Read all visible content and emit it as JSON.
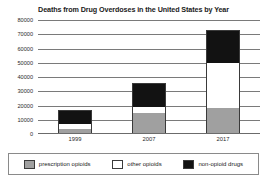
{
  "chart_data": {
    "type": "bar",
    "subtype": "stacked-bar",
    "title": "Deaths from Drug Overdoses in the United States by Year",
    "xlabel": "",
    "ylabel": "",
    "categories": [
      "1999",
      "2007",
      "2017"
    ],
    "series": [
      {
        "name": "prescription opioids",
        "color": "#a0a0a0",
        "values": [
          3000,
          14000,
          17500
        ]
      },
      {
        "name": "other opioids",
        "color": "#ffffff",
        "values": [
          3000,
          4000,
          31500
        ]
      },
      {
        "name": "non-opioid drugs",
        "color": "#121212",
        "values": [
          10000,
          17000,
          23500
        ]
      }
    ],
    "totals": [
      16000,
      35000,
      72500
    ],
    "ylim": [
      0,
      80000
    ],
    "yticks": [
      0,
      10000,
      20000,
      30000,
      40000,
      50000,
      60000,
      70000,
      80000
    ],
    "ytick_labels": [
      "0",
      "10000",
      "20000",
      "30000",
      "40000",
      "50000",
      "60000",
      "70000",
      "80000"
    ],
    "grid": true,
    "legend_position": "bottom"
  },
  "legend": {
    "items": [
      {
        "label": "prescription opioids",
        "swatch": "prescription"
      },
      {
        "label": "other opioids",
        "swatch": "other"
      },
      {
        "label": "non-opioid drugs",
        "swatch": "nonopioid"
      }
    ]
  }
}
